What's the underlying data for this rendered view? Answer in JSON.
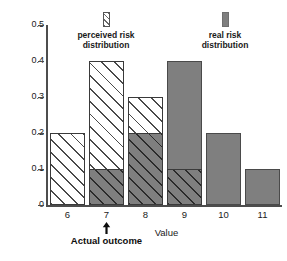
{
  "chart_data": {
    "type": "bar",
    "title": "",
    "xlabel": "Value",
    "ylabel": "Probability",
    "categories": [
      "6",
      "7",
      "8",
      "9",
      "10",
      "11"
    ],
    "ylim": [
      0,
      0.5
    ],
    "y_ticks": [
      "0",
      "0.1",
      "0.2",
      "0.3",
      "0.4",
      "0.5"
    ],
    "y_tick_values": [
      0,
      0.1,
      0.2,
      0.3,
      0.4,
      0.5
    ],
    "grid": false,
    "legend_position": "top",
    "series": [
      {
        "name": "perceived risk distribution",
        "style": "hatched",
        "color": "#ffffff",
        "values": [
          0.2,
          0.4,
          0.3,
          0.1,
          0,
          0
        ]
      },
      {
        "name": "real risk distribution",
        "style": "solid",
        "color": "#7f7f7f",
        "values": [
          0,
          0.1,
          0.2,
          0.4,
          0.2,
          0.1
        ]
      }
    ],
    "annotations": [
      {
        "name": "actual-outcome",
        "label": "Actual outcome",
        "at_category": "7",
        "marker": "up-arrow"
      }
    ]
  },
  "legend": {
    "perceived": {
      "line1": "perceived risk",
      "line2": "distribution",
      "swatch": "hatched-swatch-icon"
    },
    "real": {
      "line1": "real risk",
      "line2": "distribution",
      "swatch": "solid-gray-swatch-icon"
    }
  },
  "axes": {
    "y_title": "Probability",
    "x_title": "Value"
  },
  "annotation": {
    "actual_outcome_label": "Actual outcome"
  }
}
